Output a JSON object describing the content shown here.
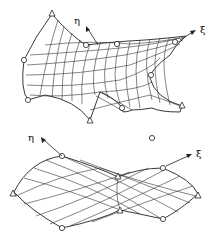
{
  "diagram": {
    "top_surface": {
      "axes": [
        {
          "label": "η",
          "name": "eta"
        },
        {
          "label": "ξ",
          "name": "xi"
        }
      ]
    },
    "bottom_surface": {
      "axes": [
        {
          "label": "η",
          "name": "eta"
        },
        {
          "label": "ξ",
          "name": "xi"
        }
      ]
    },
    "legend": {
      "corner_node_shape": "triangle",
      "midside_node_shape": "circle"
    }
  }
}
